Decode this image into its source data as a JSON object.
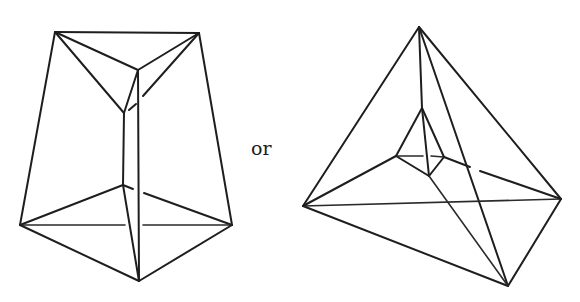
{
  "figures": [
    {
      "name": "truncated-pyramid-view",
      "description": "Triangular frustum-like polyhedron with inner edges drawn (line drawing)"
    },
    {
      "name": "tetrahedron-with-inner-tetrahedron-view",
      "description": "Outer tetrahedron-like solid with small inner tetrahedron (line drawing)"
    }
  ],
  "connector_text": "or",
  "colors": {
    "ink": "#1e1e1e",
    "background": "#ffffff"
  }
}
